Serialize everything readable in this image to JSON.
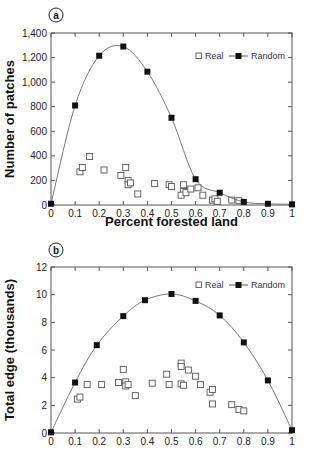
{
  "chart_data": [
    {
      "type": "line",
      "panel_label": "a",
      "title": "",
      "xlabel": "Percent forested land",
      "ylabel": "Number of patches",
      "xlim": [
        0,
        1
      ],
      "ylim": [
        0,
        1400
      ],
      "xticks": [
        0,
        0.1,
        0.2,
        0.3,
        0.4,
        0.5,
        0.6,
        0.7,
        0.8,
        0.9,
        1
      ],
      "xtick_labels": [
        "0",
        "0.1",
        "0.2",
        "0.3",
        "0.4",
        "0.5",
        "0.6",
        "0.7",
        "0.8",
        "0.9",
        "1"
      ],
      "yticks": [
        0,
        200,
        400,
        600,
        800,
        1000,
        1200,
        1400
      ],
      "ytick_labels": [
        "0",
        "200",
        "400",
        "600",
        "800",
        "1,000",
        "1,200",
        "1,400"
      ],
      "grid": false,
      "legend": {
        "position": "top-right",
        "entries": [
          "Real",
          "Random"
        ]
      },
      "series": [
        {
          "name": "Real",
          "style": "open-square-markers",
          "points": [
            [
              0.12,
              270
            ],
            [
              0.13,
              305
            ],
            [
              0.16,
              395
            ],
            [
              0.22,
              285
            ],
            [
              0.29,
              240
            ],
            [
              0.31,
              305
            ],
            [
              0.32,
              200
            ],
            [
              0.32,
              165
            ],
            [
              0.33,
              180
            ],
            [
              0.36,
              90
            ],
            [
              0.43,
              175
            ],
            [
              0.49,
              165
            ],
            [
              0.5,
              150
            ],
            [
              0.55,
              165
            ],
            [
              0.55,
              110
            ],
            [
              0.54,
              80
            ],
            [
              0.56,
              100
            ],
            [
              0.58,
              130
            ],
            [
              0.61,
              140
            ],
            [
              0.63,
              80
            ],
            [
              0.67,
              40
            ],
            [
              0.68,
              50
            ],
            [
              0.69,
              30
            ],
            [
              0.75,
              40
            ],
            [
              0.78,
              35
            ]
          ]
        },
        {
          "name": "Random",
          "style": "filled-square-line",
          "points": [
            [
              0,
              10
            ],
            [
              0.1,
              810
            ],
            [
              0.2,
              1215
            ],
            [
              0.3,
              1290
            ],
            [
              0.4,
              1085
            ],
            [
              0.5,
              710
            ],
            [
              0.6,
              210
            ],
            [
              0.7,
              100
            ],
            [
              0.8,
              25
            ],
            [
              0.9,
              10
            ],
            [
              1,
              5
            ]
          ]
        }
      ]
    },
    {
      "type": "line",
      "panel_label": "b",
      "title": "",
      "xlabel": "",
      "ylabel": "Total edge (thousands)",
      "xlim": [
        0,
        1
      ],
      "ylim": [
        0,
        12
      ],
      "xticks": [
        0,
        0.1,
        0.2,
        0.3,
        0.4,
        0.5,
        0.6,
        0.7,
        0.8,
        0.9,
        1
      ],
      "xtick_labels": [
        "0",
        "0.1",
        "0.2",
        "0.3",
        "0.4",
        "0.5",
        "0.6",
        "0.7",
        "0.8",
        "0.9",
        "1"
      ],
      "yticks": [
        0,
        2,
        4,
        6,
        8,
        10,
        12
      ],
      "ytick_labels": [
        "0",
        "2",
        "4",
        "6",
        "8",
        "10",
        "12"
      ],
      "grid": false,
      "legend": {
        "position": "top-right",
        "entries": [
          "Real",
          "Random"
        ]
      },
      "series": [
        {
          "name": "Real",
          "style": "open-square-markers",
          "points": [
            [
              0.11,
              2.45
            ],
            [
              0.12,
              2.6
            ],
            [
              0.15,
              3.5
            ],
            [
              0.21,
              3.5
            ],
            [
              0.28,
              3.65
            ],
            [
              0.3,
              4.6
            ],
            [
              0.31,
              3.7
            ],
            [
              0.31,
              3.4
            ],
            [
              0.32,
              3.5
            ],
            [
              0.35,
              2.7
            ],
            [
              0.42,
              3.6
            ],
            [
              0.48,
              4.25
            ],
            [
              0.49,
              3.5
            ],
            [
              0.54,
              5.05
            ],
            [
              0.54,
              4.8
            ],
            [
              0.54,
              3.55
            ],
            [
              0.55,
              3.45
            ],
            [
              0.57,
              4.55
            ],
            [
              0.6,
              4.1
            ],
            [
              0.62,
              3.5
            ],
            [
              0.66,
              2.95
            ],
            [
              0.67,
              3.15
            ],
            [
              0.67,
              2.1
            ],
            [
              0.75,
              2.05
            ],
            [
              0.78,
              1.7
            ],
            [
              0.8,
              1.6
            ]
          ]
        },
        {
          "name": "Random",
          "style": "filled-square-line",
          "points": [
            [
              0,
              0.05
            ],
            [
              0.1,
              3.65
            ],
            [
              0.19,
              6.35
            ],
            [
              0.3,
              8.45
            ],
            [
              0.39,
              9.6
            ],
            [
              0.5,
              10.05
            ],
            [
              0.6,
              9.55
            ],
            [
              0.7,
              8.5
            ],
            [
              0.8,
              6.55
            ],
            [
              0.9,
              3.8
            ],
            [
              1,
              0.2
            ]
          ]
        }
      ]
    }
  ]
}
